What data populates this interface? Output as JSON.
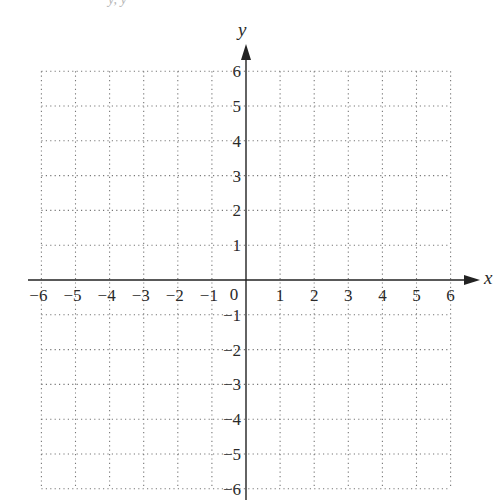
{
  "figure": {
    "type": "coordinate-grid",
    "top_fragment": "y, y",
    "x_axis": {
      "label": "x",
      "min": -6,
      "max": 6,
      "ticks": [
        "−6",
        "−5",
        "−4",
        "−3",
        "−2",
        "−1",
        "1",
        "2",
        "3",
        "4",
        "5",
        "6"
      ],
      "values": [
        -6,
        -5,
        -4,
        -3,
        -2,
        -1,
        1,
        2,
        3,
        4,
        5,
        6
      ]
    },
    "y_axis": {
      "label": "y",
      "min": -6,
      "max": 6,
      "ticks": [
        "6",
        "5",
        "4",
        "3",
        "2",
        "1",
        "−1",
        "−2",
        "−3",
        "−4",
        "−5",
        "−6"
      ],
      "values": [
        6,
        5,
        4,
        3,
        2,
        1,
        -1,
        -2,
        -3,
        -4,
        -5,
        -6
      ]
    },
    "origin_label": "0",
    "grid": {
      "style": "dotted",
      "step": 1,
      "color": "#777777"
    },
    "axis_color": "#222222"
  }
}
